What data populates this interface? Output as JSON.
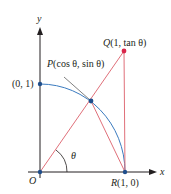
{
  "diagram": {
    "axes": {
      "x_label": "x",
      "y_label": "y"
    },
    "points": {
      "origin": {
        "label": "O"
      },
      "y_intercept": {
        "label": "(0, 1)"
      },
      "P": {
        "name": "P",
        "coords": "(cos θ, sin θ)"
      },
      "Q": {
        "name": "Q",
        "coords": "(1, tan θ)"
      },
      "R": {
        "name": "R",
        "coords": "(1, 0)"
      }
    },
    "angle": {
      "label": "θ"
    },
    "colors": {
      "axis": "#231f20",
      "arc": "#3b7bbf",
      "line": "#e0707a",
      "point_blue": "#1f4e8c",
      "point_red": "#d9264a",
      "leader": "#4a4a4a"
    }
  }
}
